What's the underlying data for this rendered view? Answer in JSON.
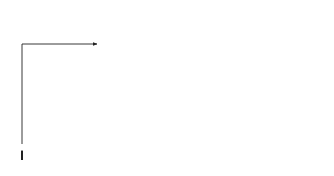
{
  "nodes": [
    {
      "id": "1",
      "label": "1"
    },
    {
      "id": "2",
      "label": "2"
    },
    {
      "id": "3",
      "label": "3"
    },
    {
      "id": "4",
      "label": "4"
    },
    {
      "id": "5",
      "label": "5"
    },
    {
      "id": "6",
      "label": "6"
    }
  ],
  "activities": {
    "A": {
      "name": "A",
      "duration": "3",
      "table": {
        "es": "0",
        "ls": "0",
        "tf": "0",
        "ef": "3",
        "lf": "3"
      }
    },
    "B": {
      "name": "B",
      "duration": "2",
      "table": {
        "es": "0",
        "ls": "1",
        "tf": "1",
        "ef": "2",
        "lf": "3"
      }
    },
    "C": {
      "name": "C",
      "duration": "3",
      "table": {
        "es": "2",
        "ls": "3",
        "tf": "1",
        "ef": "5",
        "lf": "6"
      }
    },
    "D": {
      "name": "D",
      "duration": "2",
      "table": {
        "es": "2",
        "ls": "4",
        "tf": "2",
        "ef": "4",
        "lf": "6"
      }
    },
    "E": {
      "name": "E",
      "duration": "3",
      "table": {
        "es": "3",
        "ls": "3",
        "tf": "0",
        "ef": "6",
        "lf": "6"
      }
    },
    "F": {
      "name": "F",
      "duration": "2",
      "table": {
        "es": "6",
        "ls": "7",
        "tf": "1",
        "ef": "8",
        "lf": "9"
      }
    },
    "G": {
      "name": "G",
      "duration": "3",
      "table": {
        "es": "6",
        "ls": "6",
        "tf": "0",
        "ef": "9",
        "lf": "9"
      }
    }
  },
  "dummies": [
    {
      "from": "2",
      "to": "3"
    },
    {
      "from": "4",
      "to": "5"
    }
  ]
}
